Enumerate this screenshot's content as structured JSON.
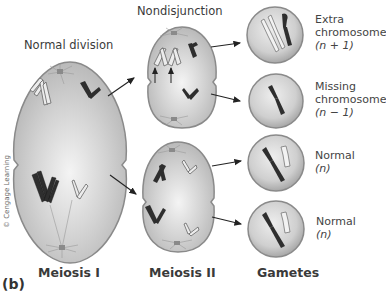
{
  "figure": {
    "part_label": "(b)",
    "credit": "© Cengage Learning",
    "headers": {
      "normal_division": "Normal division",
      "nondisjunction": "Nondisjunction"
    },
    "stages": {
      "meiosis_1": "Meiosis I",
      "meiosis_2": "Meiosis II",
      "gametes": "Gametes"
    },
    "gametes": [
      {
        "line1": "Extra",
        "line2": "chromosome",
        "formula": "(n + 1)"
      },
      {
        "line1": "Missing",
        "line2": "chromosome",
        "formula": "(n − 1)"
      },
      {
        "line1": "Normal",
        "line2": "",
        "formula": "(n)"
      },
      {
        "line1": "Normal",
        "line2": "",
        "formula": "(n)"
      }
    ],
    "colors": {
      "cell_fill": "#c8c8c8",
      "cell_edge": "#8a8a8a",
      "dark_chromosome": "#2e2e2e",
      "light_chromosome": "#e8e8e8",
      "arrow": "#222222"
    }
  }
}
